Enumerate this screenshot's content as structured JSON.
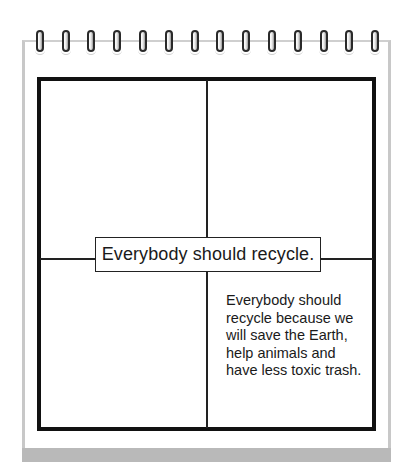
{
  "diagram": {
    "type": "four-square writing organizer on spiral notepad",
    "ring_count": 14,
    "colors": {
      "frame": "#111111",
      "page_border": "#c8c8c8",
      "shadow": "#b9b9b9",
      "text": "#1a1a1a"
    },
    "center_label": "Everybody should recycle.",
    "quadrants": {
      "top_left": "",
      "top_right": "",
      "bottom_left": "",
      "bottom_right": "Everybody should recycle because we will save the Earth, help animals and have less toxic trash."
    }
  }
}
